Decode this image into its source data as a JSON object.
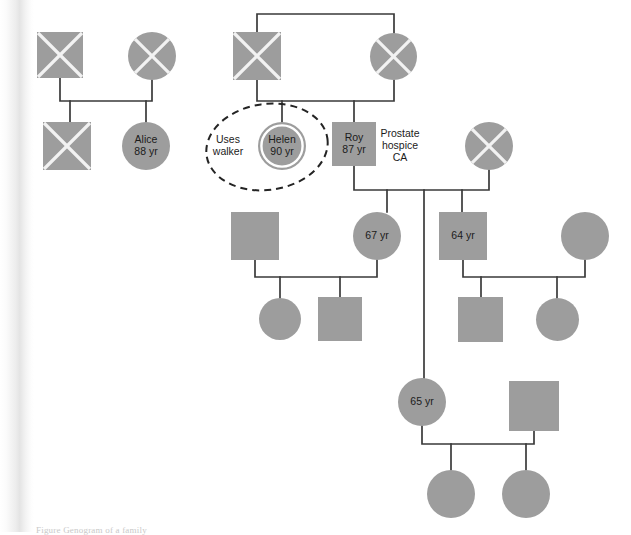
{
  "figure": {
    "caption": "Figure  Genogram of a family",
    "symbol_legend": {
      "square": "male",
      "circle": "female",
      "cross": "deceased",
      "double_ring": "identified patient",
      "dashed_ellipse": "note grouping"
    },
    "colors": {
      "shape_fill": "#9d9d9d",
      "cross_stroke": "#f2f2f2",
      "line_stroke": "#3a3a3a",
      "dashed_stroke": "#242424",
      "background": "#ffffff",
      "text": "#1b1b1b"
    }
  },
  "persons": [
    {
      "id": "g1_m_left",
      "shape": "square",
      "deceased": true,
      "x": 37,
      "y": 32,
      "size": 46,
      "label": ""
    },
    {
      "id": "g1_f_left",
      "shape": "circle",
      "deceased": true,
      "x": 128,
      "y": 32,
      "size": 48,
      "label": ""
    },
    {
      "id": "g1_m_mid",
      "shape": "square",
      "deceased": true,
      "x": 233,
      "y": 32,
      "size": 48,
      "label": ""
    },
    {
      "id": "g1_f_right",
      "shape": "circle",
      "deceased": true,
      "x": 370,
      "y": 33,
      "size": 47,
      "label": ""
    },
    {
      "id": "g2_m_left",
      "shape": "square",
      "deceased": true,
      "x": 43,
      "y": 122,
      "size": 48,
      "label": ""
    },
    {
      "id": "g2_alice",
      "shape": "circle",
      "deceased": false,
      "x": 122,
      "y": 122,
      "size": 48,
      "label": "Alice\n88 yr"
    },
    {
      "id": "g2_helen",
      "shape": "circle",
      "deceased": false,
      "identified_patient": true,
      "x": 258,
      "y": 122,
      "size": 48,
      "label": "Helen\n90 yr"
    },
    {
      "id": "g2_roy",
      "shape": "square",
      "deceased": false,
      "x": 332,
      "y": 122,
      "size": 44,
      "label": "Roy\n87 yr"
    },
    {
      "id": "g2_f_right",
      "shape": "circle",
      "deceased": true,
      "x": 465,
      "y": 122,
      "size": 48,
      "label": ""
    },
    {
      "id": "g3_m_a",
      "shape": "square",
      "deceased": false,
      "x": 231,
      "y": 212,
      "size": 48,
      "label": ""
    },
    {
      "id": "g3_f_67",
      "shape": "circle",
      "deceased": false,
      "x": 353,
      "y": 212,
      "size": 48,
      "label": "67 yr"
    },
    {
      "id": "g3_m_64",
      "shape": "square",
      "deceased": false,
      "x": 439,
      "y": 212,
      "size": 48,
      "label": "64 yr"
    },
    {
      "id": "g3_f_b",
      "shape": "circle",
      "deceased": false,
      "x": 561,
      "y": 212,
      "size": 48,
      "label": ""
    },
    {
      "id": "g4_f_a",
      "shape": "circle",
      "deceased": false,
      "x": 259,
      "y": 298,
      "size": 42,
      "label": ""
    },
    {
      "id": "g4_m_a",
      "shape": "square",
      "deceased": false,
      "x": 318,
      "y": 297,
      "size": 44,
      "label": ""
    },
    {
      "id": "g4_m_b",
      "shape": "square",
      "deceased": false,
      "x": 458,
      "y": 297,
      "size": 45,
      "label": ""
    },
    {
      "id": "g4_f_b",
      "shape": "circle",
      "deceased": false,
      "x": 536,
      "y": 298,
      "size": 43,
      "label": ""
    },
    {
      "id": "g4_f_65",
      "shape": "circle",
      "deceased": false,
      "x": 398,
      "y": 378,
      "size": 48,
      "label": "65 yr"
    },
    {
      "id": "g4_m_65sp",
      "shape": "square",
      "deceased": false,
      "x": 509,
      "y": 381,
      "size": 50,
      "label": ""
    },
    {
      "id": "g5_f_a",
      "shape": "circle",
      "deceased": false,
      "x": 427,
      "y": 470,
      "size": 48,
      "label": ""
    },
    {
      "id": "g5_f_b",
      "shape": "circle",
      "deceased": false,
      "x": 502,
      "y": 470,
      "size": 48,
      "label": ""
    }
  ],
  "notes": [
    {
      "id": "note_walker",
      "text": "Uses\nwalker",
      "x": 228,
      "y": 146
    },
    {
      "id": "note_prostate",
      "text": "Prostate\nhospice\nCA",
      "x": 400,
      "y": 146
    }
  ],
  "groupings": [
    {
      "id": "walker-ellipse",
      "cx": 267,
      "cy": 147,
      "rx": 61,
      "ry": 43,
      "rotate": -8
    }
  ],
  "links": [
    {
      "id": "union-g1-left",
      "d": "M 60 78 L 60 101 L 152 101 L 152 80"
    },
    {
      "id": "sibline-g1-left",
      "d": "M 70 101 L 70 122 M 146 101 L 146 122"
    },
    {
      "id": "union-g1-right",
      "d": "M 257 32 L 257 14 L 394 14 L 394 33"
    },
    {
      "id": "drop-g1-mid",
      "d": "M 257 80 L 257 101 L 394 101 L 394 80"
    },
    {
      "id": "child-helen",
      "d": "M 282 101 L 282 122"
    },
    {
      "id": "child-roy",
      "d": "M 354 101 L 354 122"
    },
    {
      "id": "union-roy-right",
      "d": "M 354 166 L 354 190 L 489 190 L 489 170"
    },
    {
      "id": "sib-67",
      "d": "M 387 190 L 387 212"
    },
    {
      "id": "sib-mid-drop",
      "d": "M 424 190 L 424 378"
    },
    {
      "id": "sib-64",
      "d": "M 462 190 L 462 212"
    },
    {
      "id": "union-g3-left",
      "d": "M 255 260 L 255 277 L 377 277 L 377 260"
    },
    {
      "id": "sib-g4-a1",
      "d": "M 280 277 L 280 298"
    },
    {
      "id": "sib-g4-a2",
      "d": "M 340 277 L 340 297"
    },
    {
      "id": "union-g3-right",
      "d": "M 463 260 L 463 277 L 585 277 L 585 260"
    },
    {
      "id": "sib-g4-b1",
      "d": "M 481 277 L 481 297"
    },
    {
      "id": "sib-g4-b2",
      "d": "M 557 277 L 557 298"
    },
    {
      "id": "union-65",
      "d": "M 422 426 L 422 444 L 534 444 L 534 431"
    },
    {
      "id": "sib-g5-a",
      "d": "M 451 444 L 451 470"
    },
    {
      "id": "sib-g5-b",
      "d": "M 526 444 L 526 470"
    }
  ]
}
